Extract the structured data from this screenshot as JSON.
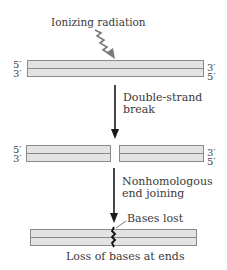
{
  "diagram": {
    "stages": [
      {
        "name": "intact-dna",
        "left_ends": [
          "5′",
          "3′"
        ],
        "right_ends": [
          "3′",
          "5′"
        ]
      },
      {
        "name": "broken-dna",
        "left_ends": [
          "5′",
          "3′"
        ],
        "right_ends": [
          "3′",
          "5′"
        ]
      },
      {
        "name": "joined-dna",
        "left_ends": [],
        "right_ends": []
      }
    ],
    "labels": {
      "ionizing_radiation": "Ionizing radiation",
      "step1_line1": "Double-strand",
      "step1_line2": "break",
      "step2_line1": "Nonhomologous",
      "step2_line2": "end joining",
      "bases_lost": "Bases lost",
      "caption": "Loss of bases at ends"
    },
    "colors": {
      "strand_fill": "#e3e3e3",
      "strand_border": "#8a8a8a",
      "arrow": "#1a1a1a",
      "radiation_arrow": "#7a7a7a"
    },
    "icons": {
      "radiation": "wavy-arrow-icon",
      "process_arrow": "down-arrow-icon",
      "break_mark": "jagged-join-icon"
    }
  }
}
